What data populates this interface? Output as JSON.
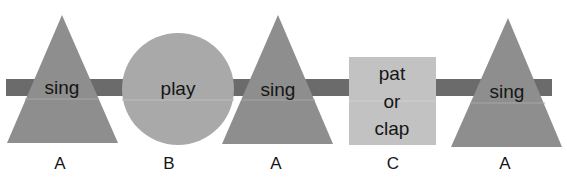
{
  "diagram": {
    "type": "musical-form",
    "band_color": "#6b6b6b",
    "shapes": [
      {
        "shape": "triangle",
        "label": "sing",
        "section": "A",
        "color": "#8e8e8e"
      },
      {
        "shape": "circle",
        "label": "play",
        "section": "B",
        "color": "#a9a9a9"
      },
      {
        "shape": "triangle",
        "label": "sing",
        "section": "A",
        "color": "#8e8e8e"
      },
      {
        "shape": "square",
        "label_lines": [
          "pat",
          "or",
          "clap"
        ],
        "section": "C",
        "color": "#c2c2c2"
      },
      {
        "shape": "triangle",
        "label": "sing",
        "section": "A",
        "color": "#8e8e8e"
      }
    ]
  }
}
